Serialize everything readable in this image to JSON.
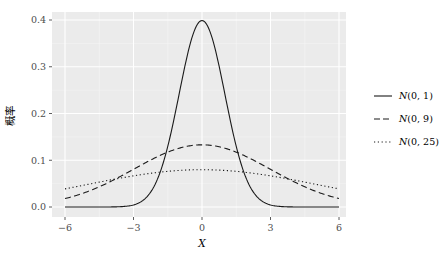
{
  "chart_data": {
    "type": "line",
    "title": "",
    "xlabel": "X",
    "ylabel": "概率",
    "xlim": [
      -6.3,
      6.3
    ],
    "ylim": [
      -0.02,
      0.42
    ],
    "xticks": [
      -6,
      -3,
      0,
      3,
      6
    ],
    "xtick_labels": [
      "−6",
      "−3",
      "0",
      "3",
      "6"
    ],
    "yticks": [
      0.0,
      0.1,
      0.2,
      0.3,
      0.4
    ],
    "ytick_labels": [
      "0.0",
      "0.1",
      "0.2",
      "0.3",
      "0.4"
    ],
    "grid": true,
    "legend_position": "right",
    "series": [
      {
        "name": "N(0, 1)",
        "mean": 0,
        "variance": 1,
        "linestyle": "solid",
        "x": [
          -6,
          -3,
          -2,
          -1,
          0,
          1,
          2,
          3,
          6
        ],
        "values": [
          0.0,
          0.004,
          0.054,
          0.242,
          0.399,
          0.242,
          0.054,
          0.004,
          0.0
        ]
      },
      {
        "name": "N(0, 9)",
        "mean": 0,
        "variance": 9,
        "linestyle": "dashed",
        "x": [
          -6,
          -3,
          0,
          3,
          6
        ],
        "values": [
          0.018,
          0.081,
          0.133,
          0.081,
          0.018
        ]
      },
      {
        "name": "N(0, 25)",
        "mean": 0,
        "variance": 25,
        "linestyle": "dotted",
        "x": [
          -6,
          -3,
          0,
          3,
          6
        ],
        "values": [
          0.039,
          0.067,
          0.08,
          0.067,
          0.039
        ]
      }
    ]
  },
  "legend": {
    "items": [
      {
        "label": "N(0, 1)",
        "prefix": "N",
        "args": "(0, 1)"
      },
      {
        "label": "N(0, 9)",
        "prefix": "N",
        "args": "(0, 9)"
      },
      {
        "label": "N(0, 25)",
        "prefix": "N",
        "args": "(0, 25)"
      }
    ]
  },
  "colors": {
    "panel": "#ebebeb",
    "grid": "#ffffff",
    "line": "#1a1a1a",
    "tick_text": "#4d4d4d"
  }
}
